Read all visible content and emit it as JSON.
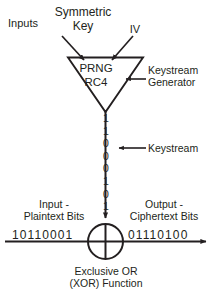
{
  "diagram": {
    "stroke_color": "#231f20",
    "text_color": "#231f20",
    "background": "#ffffff"
  },
  "top": {
    "inputs_label": "Inputs",
    "symmetric_key_label": "Symmetric\nKey",
    "iv_label": "IV"
  },
  "generator": {
    "name": "PRNG",
    "algorithm": "RC4",
    "callout_label": "Keystream\nGenerator"
  },
  "keystream": {
    "callout_label": "Keystream",
    "bits": [
      "1",
      "1",
      "0",
      "0",
      "0",
      "1",
      "0",
      "1"
    ]
  },
  "data_path": {
    "input_label": "Input -\nPlaintext Bits",
    "output_label": "Output -\nCiphertext Bits",
    "plaintext_bits": "10110001",
    "ciphertext_bits": "01110100"
  },
  "xor": {
    "caption": "Exclusive OR\n(XOR) Function"
  }
}
